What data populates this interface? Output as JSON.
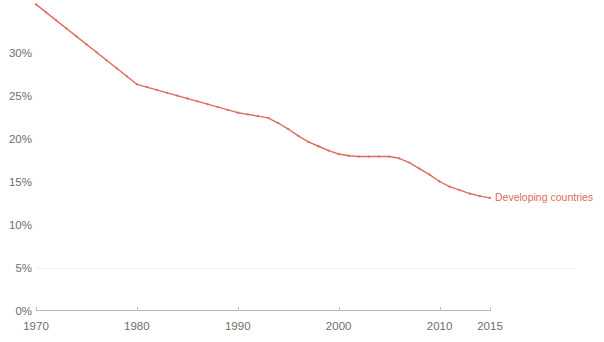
{
  "chart_data": {
    "type": "line",
    "title": "",
    "subtitle": "",
    "xlabel": "",
    "ylabel": "",
    "xlim": [
      1970,
      2015
    ],
    "ylim": [
      0,
      32
    ],
    "grid": "faint-horizontal-at-5pct",
    "legend_position": "end-of-line",
    "y_tick_labels": [
      "0%",
      "5%",
      "10%",
      "15%",
      "20%",
      "25%",
      "30%"
    ],
    "y_tick_values": [
      0,
      5,
      10,
      15,
      20,
      25,
      30
    ],
    "x_tick_labels": [
      "1970",
      "1980",
      "1990",
      "2000",
      "2010",
      "2015"
    ],
    "x_tick_values": [
      1970,
      1980,
      1990,
      2000,
      2010,
      2015
    ],
    "series": [
      {
        "name": "Developing countries",
        "color": "#dd6b5e",
        "x": [
          1970,
          1980,
          1990,
          1991,
          1992,
          1993,
          1994,
          1995,
          1996,
          1997,
          1998,
          1999,
          2000,
          2001,
          2002,
          2003,
          2004,
          2005,
          2006,
          2007,
          2008,
          2009,
          2010,
          2011,
          2012,
          2013,
          2014,
          2015
        ],
        "values": [
          35.6,
          26.3,
          23.0,
          22.8,
          22.6,
          22.4,
          21.8,
          21.1,
          20.3,
          19.6,
          19.1,
          18.6,
          18.2,
          18.0,
          17.9,
          17.9,
          17.9,
          17.9,
          17.7,
          17.2,
          16.5,
          15.8,
          15.0,
          14.4,
          14.0,
          13.6,
          13.3,
          13.1
        ]
      }
    ]
  },
  "legend": {
    "series_label": "Developing countries",
    "color": "#dd6b5e"
  },
  "axis": {
    "y_labels": [
      "30%",
      "25%",
      "20%",
      "15%",
      "10%",
      "5%",
      "0%"
    ],
    "x_labels": [
      "1970",
      "1980",
      "1990",
      "2000",
      "2010",
      "2015"
    ]
  }
}
